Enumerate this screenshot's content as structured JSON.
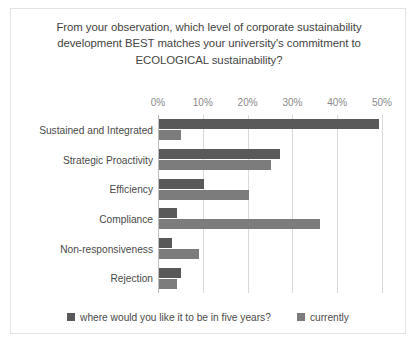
{
  "chart_data": {
    "type": "bar",
    "orientation": "horizontal",
    "title": "From your observation, which level of corporate sustainability development BEST matches your university's commitment to ECOLOGICAL sustainability?",
    "xlabel": "",
    "ylabel": "",
    "xlim": [
      0,
      50
    ],
    "xtick_labels": [
      "0%",
      "10%",
      "20%",
      "30%",
      "40%",
      "50%"
    ],
    "xticks": [
      0,
      10,
      20,
      30,
      40,
      50
    ],
    "grid": true,
    "legend_position": "bottom",
    "categories": [
      "Sustained and Integrated",
      "Strategic Proactivity",
      "Efficiency",
      "Compliance",
      "Non-responsiveness",
      "Rejection"
    ],
    "series": [
      {
        "name": "where would you like it to be in five years?",
        "color": "#595959",
        "values": [
          49,
          27,
          10,
          4,
          3,
          5
        ]
      },
      {
        "name": "currently",
        "color": "#7c7c7c",
        "values": [
          5,
          25,
          20,
          36,
          9,
          4
        ]
      }
    ]
  },
  "legend": {
    "entries": [
      {
        "label": "where would you like it to be in five years?"
      },
      {
        "label": "currently"
      }
    ]
  }
}
